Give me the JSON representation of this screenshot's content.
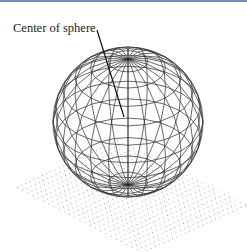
{
  "figure": {
    "label": "Center of sphere",
    "colors": {
      "top_rule": "#6f8fb8",
      "wire": "#2a2a2a",
      "grid_dot": "#9a9a9a",
      "leader": "#111111"
    },
    "sphere": {
      "cx": 128,
      "cy": 122,
      "r": 75,
      "tilt_deg": 33,
      "latitudes": 12,
      "longitudes": 24
    },
    "leader": {
      "x1": 97,
      "y1": 30,
      "x2": 124,
      "y2": 117
    },
    "grid": {
      "left": [
        17,
        187
      ],
      "top": [
        117,
        140
      ],
      "right": [
        245,
        205
      ],
      "bottom": [
        142,
        252
      ],
      "divisions": 24
    }
  }
}
